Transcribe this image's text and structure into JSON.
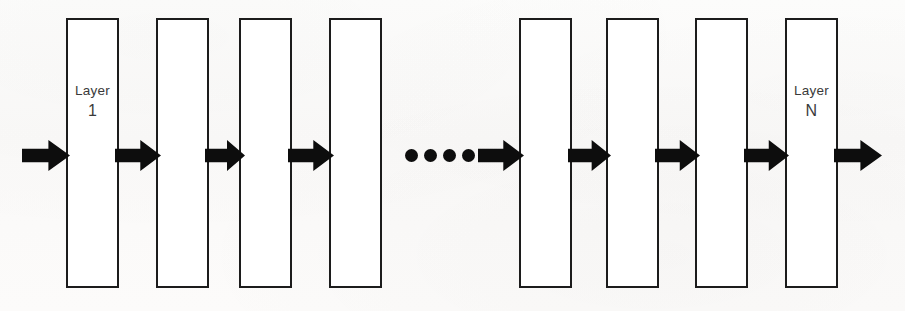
{
  "diagram": {
    "background_color": "#fbfbfa",
    "stroke_color": "#1c1c1c",
    "arrow_color": "#0d0d0d",
    "label_color": "#3a3a3a",
    "box_count": 8,
    "boxes": [
      {
        "id": "layer-1",
        "name": "Layer",
        "index": "1",
        "labeled": true,
        "x": 66,
        "y": 18,
        "width": 53,
        "height": 270
      },
      {
        "id": "layer-box-2",
        "name": "",
        "index": "",
        "labeled": false,
        "x": 156,
        "y": 18,
        "width": 53,
        "height": 270
      },
      {
        "id": "layer-box-3",
        "name": "",
        "index": "",
        "labeled": false,
        "x": 239,
        "y": 18,
        "width": 53,
        "height": 270
      },
      {
        "id": "layer-box-4",
        "name": "",
        "index": "",
        "labeled": false,
        "x": 329,
        "y": 18,
        "width": 53,
        "height": 270
      },
      {
        "id": "layer-box-5",
        "name": "",
        "index": "",
        "labeled": false,
        "x": 519,
        "y": 18,
        "width": 53,
        "height": 270
      },
      {
        "id": "layer-box-6",
        "name": "",
        "index": "",
        "labeled": false,
        "x": 606,
        "y": 18,
        "width": 53,
        "height": 270
      },
      {
        "id": "layer-box-7",
        "name": "",
        "index": "",
        "labeled": false,
        "x": 695,
        "y": 18,
        "width": 53,
        "height": 270
      },
      {
        "id": "layer-n",
        "name": "Layer",
        "index": "N",
        "labeled": true,
        "x": 785,
        "y": 18,
        "width": 53,
        "height": 270
      }
    ],
    "arrows": [
      {
        "id": "arrow-input",
        "x": 22,
        "y": 139,
        "width": 48,
        "height": 33
      },
      {
        "id": "arrow-1-to-2",
        "x": 115,
        "y": 139,
        "width": 46,
        "height": 33
      },
      {
        "id": "arrow-2-to-3",
        "x": 205,
        "y": 139,
        "width": 40,
        "height": 33
      },
      {
        "id": "arrow-3-to-4",
        "x": 288,
        "y": 139,
        "width": 46,
        "height": 33
      },
      {
        "id": "arrow-ellipsis-to-5",
        "x": 478,
        "y": 139,
        "width": 46,
        "height": 33
      },
      {
        "id": "arrow-5-to-6",
        "x": 568,
        "y": 139,
        "width": 43,
        "height": 33
      },
      {
        "id": "arrow-6-to-7",
        "x": 655,
        "y": 139,
        "width": 45,
        "height": 33
      },
      {
        "id": "arrow-7-to-n",
        "x": 744,
        "y": 139,
        "width": 45,
        "height": 33
      },
      {
        "id": "arrow-output",
        "x": 834,
        "y": 139,
        "width": 48,
        "height": 33
      }
    ],
    "ellipsis": {
      "id": "ellipsis-dots",
      "dot_count": 4,
      "x": 405,
      "y": 149,
      "dot_size": 13
    }
  }
}
